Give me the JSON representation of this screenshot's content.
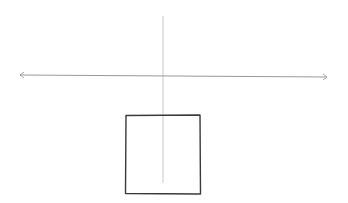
{
  "diagram": {
    "type": "hand-drawn sketch",
    "background": "#ffffff",
    "elements": {
      "horizontal_axis": {
        "x1": 20,
        "y1": 75,
        "x2": 327,
        "y2": 77,
        "arrowheads": [
          "left",
          "right"
        ],
        "color": "#9a9a9a"
      },
      "vertical_line": {
        "x": 163,
        "y1": 16,
        "y2": 183,
        "color": "#c8c8c8"
      },
      "square": {
        "x": 126,
        "y": 115,
        "width": 74,
        "height": 79,
        "stroke": "#3a3a3a"
      }
    }
  }
}
